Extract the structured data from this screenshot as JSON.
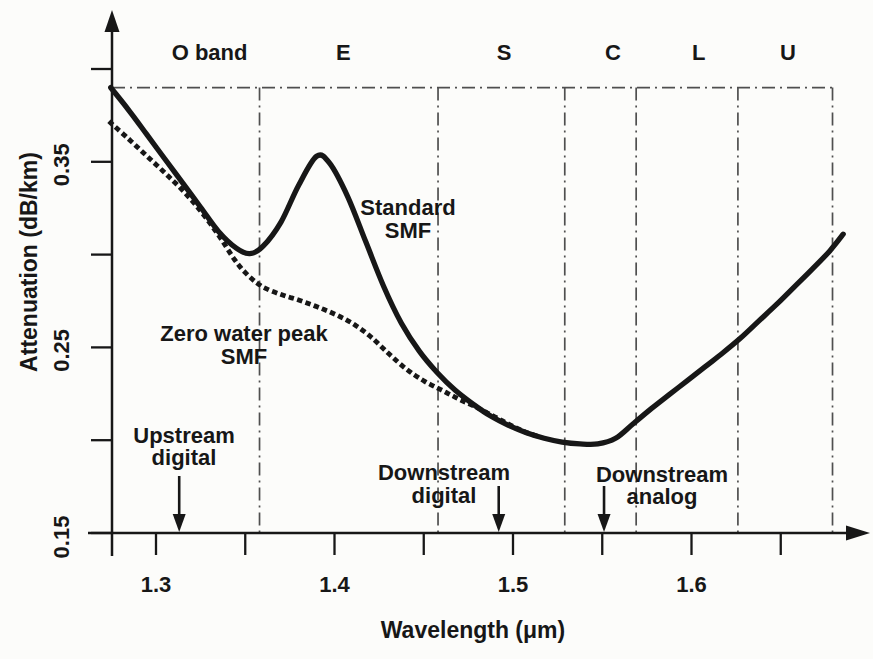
{
  "figure": {
    "background_color": "#fcfcfa",
    "ink_color": "#171717",
    "guide_line_color": "#4f4f4f"
  },
  "chart_data": {
    "type": "line",
    "title": "",
    "xlabel": "Wavelength (μm)",
    "ylabel": "Attenuation (dB/km)",
    "x_axis": {
      "unit": "μm",
      "range": [
        1.2746,
        1.6945
      ],
      "major_ticks": [
        {
          "value": 1.3,
          "label": "1.3"
        },
        {
          "value": 1.4,
          "label": "1.4"
        },
        {
          "value": 1.5,
          "label": "1.5"
        },
        {
          "value": 1.6,
          "label": "1.6"
        }
      ],
      "minor_ticks": [
        1.35,
        1.45,
        1.55,
        1.65
      ]
    },
    "y_axis": {
      "unit": "dB/km",
      "range": [
        0.15,
        0.405
      ],
      "ticks": [
        0.4,
        0.35,
        0.3,
        0.25,
        0.2,
        0.15
      ],
      "labeled_ticks": [
        {
          "value": 0.35,
          "label": "0.35"
        },
        {
          "value": 0.25,
          "label": "0.25"
        },
        {
          "value": 0.15,
          "label": "0.15"
        }
      ]
    },
    "reference_level_db_per_km": 0.39,
    "bands": {
      "boundaries_um": [
        1.358,
        1.458,
        1.529,
        1.569,
        1.626,
        1.679
      ],
      "labels": [
        {
          "text": "O band",
          "x_um": 1.33
        },
        {
          "text": "E",
          "x_um": 1.405
        },
        {
          "text": "S",
          "x_um": 1.495
        },
        {
          "text": "C",
          "x_um": 1.556
        },
        {
          "text": "L",
          "x_um": 1.604
        },
        {
          "text": "U",
          "x_um": 1.654
        }
      ]
    },
    "series": [
      {
        "name": "Standard SMF",
        "line_style": "solid",
        "label_lines": [
          "Standard",
          "SMF"
        ],
        "points": [
          [
            1.2746,
            0.39
          ],
          [
            1.285,
            0.3775
          ],
          [
            1.295,
            0.3645
          ],
          [
            1.305,
            0.3515
          ],
          [
            1.315,
            0.3385
          ],
          [
            1.325,
            0.3255
          ],
          [
            1.335,
            0.3125
          ],
          [
            1.345,
            0.3035
          ],
          [
            1.3525,
            0.3005
          ],
          [
            1.36,
            0.3045
          ],
          [
            1.37,
            0.3175
          ],
          [
            1.38,
            0.3375
          ],
          [
            1.39,
            0.353
          ],
          [
            1.3975,
            0.349
          ],
          [
            1.4075,
            0.331
          ],
          [
            1.4175,
            0.307
          ],
          [
            1.4275,
            0.283
          ],
          [
            1.4375,
            0.263
          ],
          [
            1.4475,
            0.248
          ],
          [
            1.4575,
            0.2365
          ],
          [
            1.4675,
            0.227
          ],
          [
            1.4775,
            0.2195
          ],
          [
            1.4875,
            0.213
          ],
          [
            1.4975,
            0.208
          ],
          [
            1.5075,
            0.204
          ],
          [
            1.5175,
            0.201
          ],
          [
            1.5275,
            0.199
          ],
          [
            1.5375,
            0.198
          ],
          [
            1.5475,
            0.198
          ],
          [
            1.5575,
            0.201
          ],
          [
            1.5675,
            0.209
          ],
          [
            1.5775,
            0.217
          ],
          [
            1.5875,
            0.2245
          ],
          [
            1.5975,
            0.232
          ],
          [
            1.6075,
            0.2395
          ],
          [
            1.6175,
            0.247
          ],
          [
            1.6275,
            0.255
          ],
          [
            1.6375,
            0.264
          ],
          [
            1.6475,
            0.273
          ],
          [
            1.6575,
            0.2825
          ],
          [
            1.6675,
            0.292
          ],
          [
            1.6775,
            0.302
          ],
          [
            1.685,
            0.311
          ]
        ]
      },
      {
        "name": "Zero water peak SMF",
        "line_style": "dotted",
        "label_lines": [
          "Zero water peak",
          "SMF"
        ],
        "points": [
          [
            1.2746,
            0.371
          ],
          [
            1.285,
            0.362
          ],
          [
            1.295,
            0.353
          ],
          [
            1.305,
            0.344
          ],
          [
            1.315,
            0.3345
          ],
          [
            1.325,
            0.3235
          ],
          [
            1.335,
            0.3105
          ],
          [
            1.345,
            0.296
          ],
          [
            1.3525,
            0.288
          ],
          [
            1.36,
            0.2825
          ],
          [
            1.37,
            0.2785
          ],
          [
            1.38,
            0.2755
          ],
          [
            1.39,
            0.272
          ],
          [
            1.4,
            0.268
          ],
          [
            1.41,
            0.263
          ],
          [
            1.42,
            0.256
          ],
          [
            1.43,
            0.247
          ],
          [
            1.44,
            0.2385
          ],
          [
            1.45,
            0.232
          ],
          [
            1.46,
            0.227
          ],
          [
            1.47,
            0.222
          ],
          [
            1.48,
            0.2175
          ],
          [
            1.49,
            0.2125
          ],
          [
            1.5,
            0.2075
          ],
          [
            1.508,
            0.204
          ],
          [
            1.516,
            0.2015
          ]
        ]
      }
    ],
    "annotations": [
      {
        "lines": [
          "Upstream",
          "digital"
        ],
        "arrow_points_to_um": 1.313
      },
      {
        "lines": [
          "Downstream",
          "digital"
        ],
        "arrow_points_to_um": 1.492
      },
      {
        "lines": [
          "Downstream",
          "analog"
        ],
        "arrow_points_to_um": 1.551
      }
    ]
  }
}
